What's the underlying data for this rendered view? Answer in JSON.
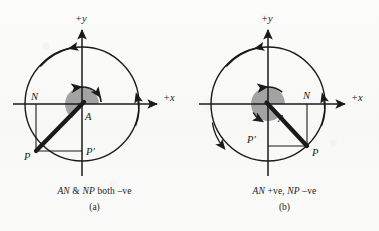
{
  "page": {
    "background_color": "#fbfbfa",
    "ink_color": "#1a1a1a",
    "shade_color": "#9e9e9e",
    "width": 379,
    "height": 231
  },
  "figures": [
    {
      "id": "a",
      "sublabel": "(a)",
      "caption_parts": {
        "seg1": "AN",
        "seg2": " & ",
        "seg3": "NP",
        "seg4": " both –ve"
      },
      "caption_text": "AN & NP both –ve",
      "axis_x_label": "+x",
      "axis_y_label": "+y",
      "point_labels": {
        "center": "A",
        "foot_x": "N",
        "foot_y": "P′",
        "terminal": "P"
      },
      "geometry": {
        "center_x": 82,
        "center_y": 104,
        "radius": 57,
        "angle_deg": 235,
        "terminal_x": 36,
        "terminal_y": 151,
        "shade_radius": 17
      }
    },
    {
      "id": "b",
      "sublabel": "(b)",
      "caption_parts": {
        "seg1": "AN",
        "seg2": " +ve, ",
        "seg3": "NP",
        "seg4": " –ve"
      },
      "caption_text": "AN +ve, NP –ve",
      "axis_x_label": "+x",
      "axis_y_label": "+y",
      "point_labels": {
        "center": "A",
        "foot_x": "N",
        "foot_y": "P′",
        "terminal": "P"
      },
      "geometry": {
        "center_x": 78,
        "center_y": 104,
        "radius": 57,
        "angle_deg": 313,
        "terminal_x": 117,
        "terminal_y": 146,
        "shade_radius": 17
      }
    }
  ]
}
